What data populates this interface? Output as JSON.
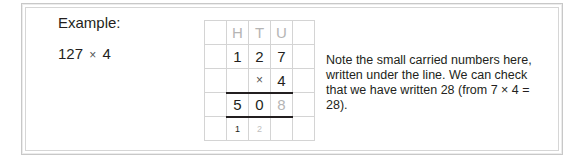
{
  "heading": "Example:",
  "problem": {
    "left": "127",
    "operator": "×",
    "right": "4"
  },
  "grid": {
    "headers": [
      "",
      "H",
      "T",
      "U",
      ""
    ],
    "row_multiplicand": [
      "",
      "1",
      "2",
      "7",
      ""
    ],
    "row_multiplier": [
      "",
      "",
      "×",
      "4",
      ""
    ],
    "row_result": [
      "",
      "5",
      "0",
      "8",
      ""
    ],
    "row_carries": [
      "",
      "1",
      "2",
      "",
      ""
    ]
  },
  "note": "Note the small carried numbers here, written under the line. We can check that we have written 28 (from 7 × 4 = 28).",
  "colors": {
    "text": "#231f20",
    "faded": "#b5b5b5",
    "grid_line": "#d4d4d4",
    "frame": "#c8c8c8"
  }
}
